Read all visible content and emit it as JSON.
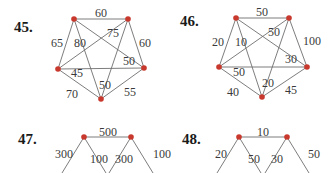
{
  "problems": [
    {
      "number": "45.",
      "nodes": [
        [
          74,
          19
        ],
        [
          128,
          19
        ],
        [
          58,
          69
        ],
        [
          144,
          68
        ],
        [
          101,
          99
        ]
      ],
      "edges": [
        [
          0,
          1
        ],
        [
          0,
          2
        ],
        [
          0,
          3
        ],
        [
          0,
          4
        ],
        [
          1,
          2
        ],
        [
          1,
          3
        ],
        [
          1,
          4
        ],
        [
          2,
          3
        ],
        [
          2,
          4
        ],
        [
          3,
          4
        ]
      ],
      "labels": [
        {
          "text": "60",
          "x": 101,
          "y": 14
        },
        {
          "text": "65",
          "x": 57,
          "y": 44
        },
        {
          "text": "80",
          "x": 80,
          "y": 44
        },
        {
          "text": "75",
          "x": 113,
          "y": 34
        },
        {
          "text": "60",
          "x": 145,
          "y": 44
        },
        {
          "text": "50",
          "x": 129,
          "y": 62
        },
        {
          "text": "45",
          "x": 77,
          "y": 74
        },
        {
          "text": "50",
          "x": 105,
          "y": 86
        },
        {
          "text": "70",
          "x": 72,
          "y": 95
        },
        {
          "text": "55",
          "x": 130,
          "y": 93
        }
      ]
    },
    {
      "number": "46.",
      "nodes": [
        [
          236,
          18
        ],
        [
          289,
          18
        ],
        [
          219,
          67
        ],
        [
          307,
          67
        ],
        [
          262,
          97
        ]
      ],
      "edges": [
        [
          0,
          1
        ],
        [
          0,
          2
        ],
        [
          0,
          3
        ],
        [
          0,
          4
        ],
        [
          1,
          2
        ],
        [
          1,
          3
        ],
        [
          1,
          4
        ],
        [
          2,
          3
        ],
        [
          2,
          4
        ],
        [
          3,
          4
        ]
      ],
      "labels": [
        {
          "text": "50",
          "x": 262,
          "y": 13
        },
        {
          "text": "20",
          "x": 218,
          "y": 43
        },
        {
          "text": "10",
          "x": 241,
          "y": 43
        },
        {
          "text": "50",
          "x": 274,
          "y": 33
        },
        {
          "text": "100",
          "x": 312,
          "y": 42
        },
        {
          "text": "30",
          "x": 291,
          "y": 60
        },
        {
          "text": "50",
          "x": 239,
          "y": 73
        },
        {
          "text": "20",
          "x": 268,
          "y": 84
        },
        {
          "text": "40",
          "x": 233,
          "y": 93
        },
        {
          "text": "45",
          "x": 291,
          "y": 91
        }
      ]
    },
    {
      "number": "47.",
      "nodes": [
        [
          84,
          137
        ],
        [
          131,
          137
        ]
      ],
      "edges": [
        [
          0,
          1
        ]
      ],
      "stubs": [
        [
          84,
          137,
          62,
          173
        ],
        [
          84,
          137,
          106,
          173
        ],
        [
          131,
          137,
          109,
          173
        ],
        [
          131,
          137,
          153,
          173
        ]
      ],
      "labels": [
        {
          "text": "500",
          "x": 108,
          "y": 133
        },
        {
          "text": "300",
          "x": 64,
          "y": 155
        },
        {
          "text": "100",
          "x": 99,
          "y": 160
        },
        {
          "text": "300",
          "x": 124,
          "y": 160
        },
        {
          "text": "100",
          "x": 162,
          "y": 155
        }
      ]
    },
    {
      "number": "48.",
      "nodes": [
        [
          239,
          137
        ],
        [
          287,
          137
        ]
      ],
      "edges": [
        [
          0,
          1
        ]
      ],
      "stubs": [
        [
          239,
          137,
          217,
          173
        ],
        [
          239,
          137,
          261,
          173
        ],
        [
          287,
          137,
          265,
          173
        ],
        [
          287,
          137,
          309,
          173
        ]
      ],
      "labels": [
        {
          "text": "10",
          "x": 263,
          "y": 133
        },
        {
          "text": "20",
          "x": 221,
          "y": 155
        },
        {
          "text": "50",
          "x": 254,
          "y": 160
        },
        {
          "text": "30",
          "x": 277,
          "y": 160
        },
        {
          "text": "50",
          "x": 314,
          "y": 155
        }
      ]
    }
  ],
  "number_positions": [
    [
      14,
      32
    ],
    [
      180,
      26
    ],
    [
      18,
      144
    ],
    [
      182,
      144
    ]
  ],
  "colors": {
    "node": "#c8382c",
    "edge": "#6e6e6e",
    "text": "#1a1a1a"
  }
}
